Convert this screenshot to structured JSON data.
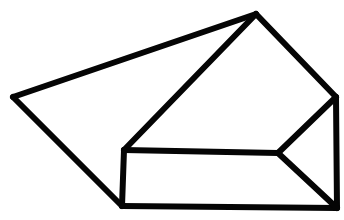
{
  "figure": {
    "title": "3D wedge prism line drawing",
    "type": "line-drawing",
    "background_color": "#ffffff",
    "stroke_color": "#050505",
    "stroke_width": 6,
    "canvas": {
      "width": 344,
      "height": 220
    },
    "vertices": {
      "left_point": {
        "label": "A",
        "x": 13,
        "y": 97
      },
      "top_apex": {
        "label": "B",
        "x": 256,
        "y": 14
      },
      "right_upper": {
        "label": "C",
        "x": 336,
        "y": 97
      },
      "right_lower": {
        "label": "D",
        "x": 337,
        "y": 208
      },
      "bottom_left": {
        "label": "E",
        "x": 122,
        "y": 206
      },
      "rect_top_left": {
        "label": "F",
        "x": 124,
        "y": 150
      },
      "mid_right_junction": {
        "label": "G",
        "x": 278,
        "y": 153
      }
    },
    "edges": [
      {
        "name": "edge-left-to-apex",
        "from": "left_point",
        "to": "top_apex"
      },
      {
        "name": "edge-apex-to-right-upper",
        "from": "top_apex",
        "to": "right_upper"
      },
      {
        "name": "edge-right-vertical",
        "from": "right_upper",
        "to": "right_lower"
      },
      {
        "name": "edge-bottom-horizontal",
        "from": "right_lower",
        "to": "bottom_left"
      },
      {
        "name": "edge-bottom-left-to-left",
        "from": "bottom_left",
        "to": "left_point"
      },
      {
        "name": "edge-rect-left-vertical",
        "from": "rect_top_left",
        "to": "bottom_left"
      },
      {
        "name": "edge-apex-to-rect-corner",
        "from": "top_apex",
        "to": "rect_top_left"
      },
      {
        "name": "edge-rect-top-horizontal",
        "from": "rect_top_left",
        "to": "mid_right_junction"
      },
      {
        "name": "edge-junction-to-upper",
        "from": "mid_right_junction",
        "to": "right_upper"
      },
      {
        "name": "edge-junction-to-lower",
        "from": "mid_right_junction",
        "to": "right_lower"
      }
    ],
    "faces": [
      {
        "name": "face-top-left-slope",
        "path": "left_point,top_apex,rect_top_left,bottom_left"
      },
      {
        "name": "face-front-slope",
        "path": "top_apex,right_upper,mid_right_junction,rect_top_left"
      },
      {
        "name": "face-front-rect",
        "path": "rect_top_left,mid_right_junction,right_lower,bottom_left"
      },
      {
        "name": "face-right-triangle",
        "path": "mid_right_junction,right_upper,right_lower"
      }
    ]
  }
}
